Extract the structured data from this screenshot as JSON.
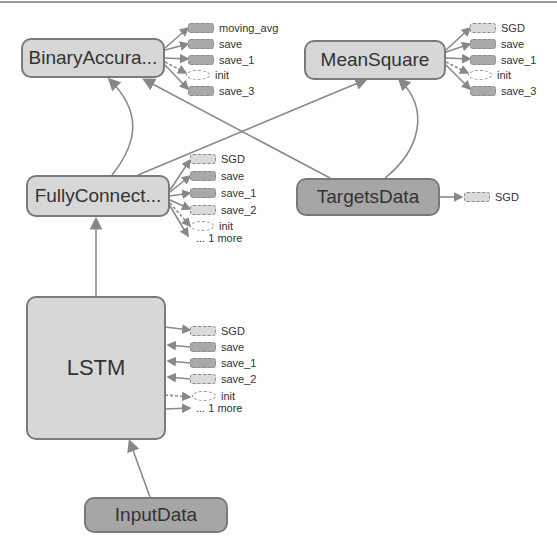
{
  "graph": {
    "nodes": {
      "binary_accuracy": {
        "label": "BinaryAccura...",
        "style": "light"
      },
      "mean_square": {
        "label": "MeanSquare",
        "style": "light"
      },
      "fully_connected": {
        "label": "FullyConnect...",
        "style": "light"
      },
      "targets_data": {
        "label": "TargetsData",
        "style": "dark"
      },
      "lstm": {
        "label": "LSTM",
        "style": "light"
      },
      "input_data": {
        "label": "InputData",
        "style": "dark"
      }
    },
    "aux": {
      "binary_accuracy": [
        "moving_avg",
        "save",
        "save_1",
        "init",
        "save_3"
      ],
      "mean_square": [
        "SGD",
        "save",
        "save_1",
        "init",
        "save_3"
      ],
      "fully_connected": [
        "SGD",
        "save",
        "save_1",
        "save_2",
        "init",
        "... 1 more"
      ],
      "targets_data": [
        "SGD"
      ],
      "lstm": [
        "SGD",
        "save",
        "save_1",
        "save_2",
        "init",
        "... 1 more"
      ]
    },
    "edges": [
      {
        "from": "input_data",
        "to": "lstm",
        "label": "?x??x?"
      },
      {
        "from": "lstm",
        "to": "fully_connected",
        "label": "?x??"
      },
      {
        "from": "fully_connected",
        "to": "binary_accuracy",
        "label": "?x1"
      },
      {
        "from": "fully_connected",
        "to": "mean_square",
        "label": "?x1"
      },
      {
        "from": "targets_data",
        "to": "binary_accuracy",
        "label": "?x1"
      },
      {
        "from": "targets_data",
        "to": "mean_square",
        "label": "?x1"
      }
    ],
    "colors": {
      "light_node": "#d7d7d7",
      "dark_node": "#a6a6a6",
      "border": "#7a7a7a",
      "edge": "#888888"
    }
  }
}
